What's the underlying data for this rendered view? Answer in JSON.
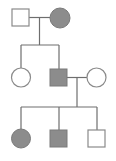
{
  "diagram": {
    "type": "pedigree",
    "colors": {
      "affected": "#8c8c8c",
      "unaffected": "#ffffff",
      "stroke": "#8a8a8a",
      "line": "#6e6e6e"
    },
    "generations": [
      {
        "label": "I",
        "individuals": [
          {
            "id": "I-1",
            "sex": "male",
            "affected": false
          },
          {
            "id": "I-2",
            "sex": "female",
            "affected": true
          }
        ]
      },
      {
        "label": "II",
        "individuals": [
          {
            "id": "II-1",
            "sex": "female",
            "affected": false
          },
          {
            "id": "II-2",
            "sex": "male",
            "affected": true
          },
          {
            "id": "II-3",
            "sex": "female",
            "affected": false,
            "married_in": true
          }
        ]
      },
      {
        "label": "III",
        "individuals": [
          {
            "id": "III-1",
            "sex": "female",
            "affected": true
          },
          {
            "id": "III-2",
            "sex": "male",
            "affected": true
          },
          {
            "id": "III-3",
            "sex": "male",
            "affected": false
          }
        ]
      }
    ]
  }
}
